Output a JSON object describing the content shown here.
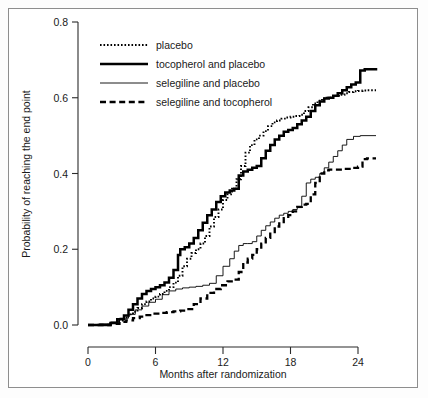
{
  "figure": {
    "name": "kaplan-meier-survival-figure",
    "background_color": "#ffffff",
    "frame_color": "#8e8e8e"
  },
  "chart_data": {
    "type": "line",
    "subtype": "kaplan-meier-step",
    "title": "",
    "xlabel": "Months after randomization",
    "ylabel": "Probability of reaching the end point",
    "xlim": [
      0,
      26
    ],
    "ylim": [
      0.0,
      0.8
    ],
    "xticks": [
      0,
      6,
      12,
      18,
      24
    ],
    "xtick_labels": [
      "0",
      "6",
      "12",
      "18",
      "24"
    ],
    "yticks": [
      0.0,
      0.2,
      0.4,
      0.6,
      0.8
    ],
    "ytick_labels": [
      "0.0",
      "0.2",
      "0.4",
      "0.6",
      "0.8"
    ],
    "grid": false,
    "legend_position": "upper-left-inside",
    "series": [
      {
        "name": "placebo",
        "style": "dotted",
        "stroke": "#000000",
        "final_value": 0.62,
        "x": [
          0,
          1.0,
          2.0,
          2.6,
          3.2,
          3.6,
          4.0,
          4.4,
          4.8,
          5.2,
          5.6,
          6.0,
          6.4,
          6.8,
          7.2,
          7.6,
          8.0,
          8.4,
          8.8,
          9.2,
          9.6,
          10.0,
          10.4,
          10.8,
          11.2,
          11.6,
          12.0,
          12.4,
          12.8,
          13.2,
          13.6,
          14.0,
          14.4,
          14.8,
          15.2,
          15.6,
          16.0,
          16.4,
          16.8,
          17.2,
          17.6,
          18.0,
          18.4,
          18.8,
          19.2,
          19.6,
          20.0,
          20.4,
          20.8,
          21.2,
          21.6,
          22.0,
          22.4,
          22.8,
          23.2,
          23.6,
          24.0,
          24.4,
          24.8,
          25.2,
          25.6
        ],
        "y": [
          0.0,
          0.0,
          0.005,
          0.012,
          0.02,
          0.028,
          0.035,
          0.045,
          0.055,
          0.062,
          0.07,
          0.075,
          0.082,
          0.09,
          0.1,
          0.112,
          0.13,
          0.155,
          0.175,
          0.19,
          0.2,
          0.215,
          0.235,
          0.26,
          0.285,
          0.305,
          0.33,
          0.345,
          0.36,
          0.385,
          0.42,
          0.455,
          0.475,
          0.49,
          0.5,
          0.512,
          0.525,
          0.535,
          0.54,
          0.545,
          0.548,
          0.55,
          0.552,
          0.555,
          0.565,
          0.575,
          0.585,
          0.592,
          0.598,
          0.6,
          0.602,
          0.605,
          0.608,
          0.612,
          0.615,
          0.617,
          0.618,
          0.619,
          0.62,
          0.62,
          0.62
        ]
      },
      {
        "name": "tocopherol and placebo",
        "style": "thick-solid",
        "stroke": "#000000",
        "final_value": 0.67,
        "x": [
          0,
          1.0,
          2.0,
          2.6,
          3.2,
          3.6,
          4.0,
          4.4,
          4.8,
          5.2,
          5.6,
          6.0,
          6.4,
          6.8,
          7.2,
          7.6,
          8.0,
          8.2,
          8.6,
          9.0,
          9.4,
          9.8,
          10.2,
          10.6,
          11.0,
          11.4,
          11.8,
          12.2,
          12.6,
          13.0,
          13.4,
          13.8,
          14.2,
          14.6,
          15.0,
          15.4,
          15.8,
          16.2,
          16.6,
          17.0,
          17.4,
          17.8,
          18.2,
          18.6,
          19.0,
          19.4,
          19.8,
          20.2,
          20.6,
          21.0,
          21.4,
          21.8,
          22.2,
          22.6,
          23.0,
          23.4,
          23.8,
          24.2,
          24.6,
          25.0,
          25.6
        ],
        "y": [
          0.0,
          0.0,
          0.005,
          0.015,
          0.025,
          0.04,
          0.055,
          0.07,
          0.082,
          0.09,
          0.095,
          0.1,
          0.105,
          0.112,
          0.125,
          0.145,
          0.185,
          0.2,
          0.205,
          0.215,
          0.23,
          0.25,
          0.27,
          0.29,
          0.305,
          0.325,
          0.34,
          0.35,
          0.355,
          0.36,
          0.395,
          0.405,
          0.41,
          0.415,
          0.42,
          0.44,
          0.46,
          0.475,
          0.49,
          0.5,
          0.51,
          0.515,
          0.52,
          0.53,
          0.54,
          0.55,
          0.565,
          0.58,
          0.59,
          0.598,
          0.6,
          0.605,
          0.612,
          0.62,
          0.628,
          0.635,
          0.64,
          0.672,
          0.675,
          0.675,
          0.672
        ]
      },
      {
        "name": "selegiline and placebo",
        "style": "thin-solid",
        "stroke": "#000000",
        "final_value": 0.5,
        "x": [
          0,
          1.0,
          2.0,
          2.8,
          3.6,
          4.2,
          4.8,
          5.4,
          6.0,
          6.6,
          7.2,
          7.8,
          8.4,
          9.0,
          9.6,
          10.2,
          10.8,
          11.4,
          12.0,
          12.6,
          13.0,
          13.4,
          13.8,
          14.2,
          14.6,
          15.0,
          15.4,
          15.8,
          16.2,
          16.6,
          17.0,
          17.4,
          17.8,
          18.2,
          18.6,
          19.0,
          19.4,
          19.8,
          20.2,
          20.6,
          21.0,
          21.4,
          21.8,
          22.2,
          22.6,
          23.0,
          23.6,
          24.2,
          24.8,
          25.6
        ],
        "y": [
          0.0,
          0.003,
          0.008,
          0.018,
          0.028,
          0.04,
          0.05,
          0.06,
          0.068,
          0.08,
          0.09,
          0.095,
          0.098,
          0.1,
          0.102,
          0.105,
          0.11,
          0.13,
          0.155,
          0.175,
          0.195,
          0.21,
          0.215,
          0.215,
          0.22,
          0.235,
          0.25,
          0.262,
          0.272,
          0.282,
          0.29,
          0.295,
          0.3,
          0.305,
          0.31,
          0.34,
          0.375,
          0.385,
          0.39,
          0.4,
          0.415,
          0.43,
          0.445,
          0.46,
          0.475,
          0.49,
          0.498,
          0.5,
          0.5,
          0.5
        ]
      },
      {
        "name": "selegiline and tocopherol",
        "style": "dashed",
        "stroke": "#000000",
        "final_value": 0.44,
        "x": [
          0,
          1.0,
          2.0,
          2.8,
          3.4,
          4.0,
          4.6,
          5.2,
          5.8,
          6.4,
          7.0,
          7.6,
          8.2,
          8.8,
          9.4,
          10.0,
          10.6,
          11.2,
          11.8,
          12.4,
          13.0,
          13.4,
          13.8,
          14.2,
          14.6,
          15.0,
          15.4,
          15.8,
          16.2,
          16.6,
          17.0,
          17.4,
          17.8,
          18.2,
          18.6,
          19.0,
          19.4,
          19.8,
          20.2,
          20.6,
          21.0,
          21.4,
          21.8,
          22.2,
          22.8,
          23.4,
          24.0,
          24.4,
          24.8,
          25.2,
          25.6
        ],
        "y": [
          0.0,
          0.0,
          0.003,
          0.008,
          0.012,
          0.018,
          0.022,
          0.026,
          0.03,
          0.032,
          0.034,
          0.036,
          0.038,
          0.042,
          0.055,
          0.07,
          0.085,
          0.095,
          0.105,
          0.115,
          0.12,
          0.14,
          0.165,
          0.175,
          0.185,
          0.2,
          0.215,
          0.23,
          0.245,
          0.26,
          0.272,
          0.282,
          0.29,
          0.3,
          0.312,
          0.318,
          0.32,
          0.345,
          0.375,
          0.4,
          0.408,
          0.41,
          0.41,
          0.41,
          0.412,
          0.415,
          0.418,
          0.438,
          0.44,
          0.44,
          0.44
        ]
      }
    ]
  },
  "legend": {
    "items": [
      {
        "label": "placebo",
        "style": "dotted"
      },
      {
        "label": "tocopherol and placebo",
        "style": "thick-solid"
      },
      {
        "label": "selegiline and placebo",
        "style": "thin-solid"
      },
      {
        "label": "selegiline and tocopherol",
        "style": "dashed"
      }
    ]
  }
}
